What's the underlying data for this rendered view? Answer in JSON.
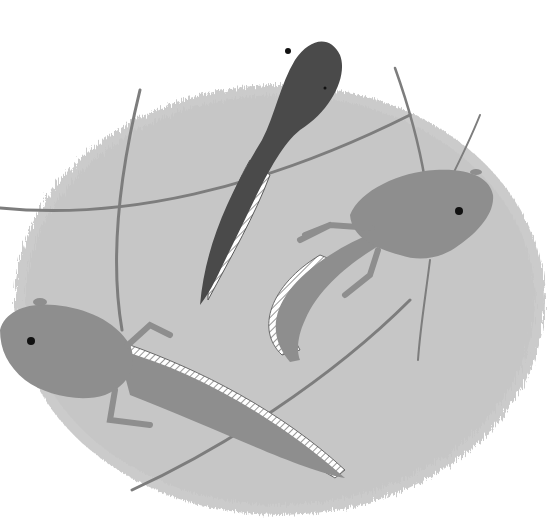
{
  "illustration": {
    "subject": "tadpoles developing into frogs",
    "colors": {
      "background": "#ffffff",
      "water_blob": "#c9c9c9",
      "water_streaks": "#b6b6b6",
      "dark_tadpole": "#4a4a4a",
      "froglet_body": "#8e8e8e",
      "fin_hatch": "#ffffff",
      "stem": "#7a7a7a",
      "eye": "#111111"
    },
    "figures": [
      {
        "name": "early-tadpole",
        "stage": "tadpole with tail"
      },
      {
        "name": "froglet-right",
        "stage": "tadpole with legs"
      },
      {
        "name": "froglet-left",
        "stage": "tadpole with legs"
      }
    ]
  }
}
